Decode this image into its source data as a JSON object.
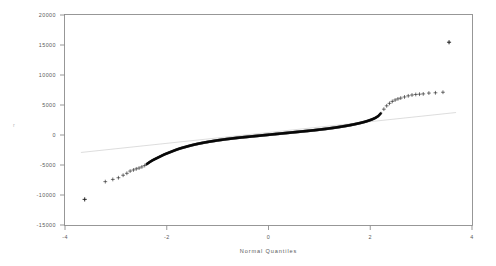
{
  "chart_data": {
    "type": "scatter",
    "title": "",
    "subtitle": "",
    "xlabel": "Normal Quantiles",
    "ylabel": "r",
    "xlim": [
      -4.35,
      4.35
    ],
    "ylim": [
      -16500,
      21500
    ],
    "xticks": [
      -4,
      -2,
      0,
      2,
      4
    ],
    "xticklabels": [
      "-4",
      "-2",
      "0",
      "2",
      "4"
    ],
    "yticks": [
      -15000,
      -10000,
      -5000,
      0,
      5000,
      10000,
      15000,
      20000
    ],
    "yticklabels": [
      "-15000",
      "-10000",
      "-5000",
      "0",
      "5000",
      "10000",
      "15000",
      "20000"
    ],
    "grid": false,
    "legend": null,
    "marker": "+",
    "marker_color": "#0b0b0b",
    "reference_line": {
      "type": "line",
      "color": "#cfcfcf",
      "slope": 900,
      "intercept": 250,
      "x_start": -4.0,
      "y_start": -3350,
      "x_end": 4.0,
      "y_end": 3850
    },
    "series": [
      {
        "name": "sample quantiles",
        "x": [
          -3.92,
          -3.48,
          -3.32,
          -3.2,
          -3.1,
          -3.02,
          -2.95,
          -2.88,
          -2.82,
          -2.76,
          -2.7,
          -2.64,
          -2.58,
          -2.52,
          -2.46,
          -2.4,
          -2.34,
          -2.28,
          -2.22,
          -2.16,
          -2.1,
          -2.04,
          -1.98,
          -1.92,
          -1.86,
          -1.8,
          -1.74,
          -1.68,
          -1.62,
          -1.56,
          -1.5,
          -1.44,
          -1.38,
          -1.32,
          -1.26,
          -1.2,
          -1.14,
          -1.08,
          -1.02,
          -0.96,
          -0.9,
          -0.84,
          -0.78,
          -0.72,
          -0.66,
          -0.6,
          -0.54,
          -0.48,
          -0.42,
          -0.36,
          -0.3,
          -0.24,
          -0.18,
          -0.12,
          -0.06,
          0.0,
          0.06,
          0.12,
          0.18,
          0.24,
          0.3,
          0.36,
          0.42,
          0.48,
          0.54,
          0.6,
          0.66,
          0.72,
          0.78,
          0.84,
          0.9,
          0.96,
          1.02,
          1.08,
          1.14,
          1.2,
          1.26,
          1.32,
          1.38,
          1.44,
          1.5,
          1.56,
          1.62,
          1.68,
          1.74,
          1.8,
          1.86,
          1.92,
          1.98,
          2.04,
          2.1,
          2.16,
          2.22,
          2.28,
          2.34,
          2.4,
          2.46,
          2.52,
          2.58,
          2.64,
          2.7,
          2.76,
          2.82,
          2.9,
          2.98,
          3.06,
          3.14,
          3.22,
          3.3,
          3.42,
          3.56,
          3.72,
          3.85
        ],
        "y": [
          -11800,
          -8600,
          -8200,
          -7900,
          -7450,
          -7100,
          -6700,
          -6500,
          -6300,
          -6150,
          -5950,
          -5700,
          -5350,
          -5000,
          -4700,
          -4450,
          -4200,
          -3950,
          -3700,
          -3500,
          -3300,
          -3100,
          -2900,
          -2720,
          -2560,
          -2420,
          -2280,
          -2140,
          -2010,
          -1890,
          -1780,
          -1680,
          -1580,
          -1490,
          -1400,
          -1320,
          -1240,
          -1160,
          -1090,
          -1020,
          -950,
          -890,
          -830,
          -770,
          -710,
          -660,
          -610,
          -560,
          -510,
          -460,
          -410,
          -360,
          -310,
          -260,
          -210,
          -160,
          -110,
          -60,
          -10,
          40,
          90,
          140,
          190,
          240,
          290,
          340,
          390,
          440,
          490,
          540,
          590,
          640,
          700,
          760,
          820,
          880,
          940,
          1010,
          1080,
          1150,
          1230,
          1310,
          1390,
          1480,
          1570,
          1670,
          1780,
          1890,
          2010,
          2140,
          2290,
          2460,
          2650,
          2880,
          3200,
          3750,
          4450,
          5050,
          5500,
          5850,
          6100,
          6300,
          6450,
          6650,
          6850,
          7000,
          7100,
          7150,
          7200,
          7350,
          7400,
          7500,
          16500
        ]
      }
    ],
    "dense_band": {
      "description": "overplotted solid band of markers from x -2.6 to x 2.4",
      "x_start": -2.6,
      "x_end": 2.4
    },
    "outliers": [
      {
        "x": -3.92,
        "y": -11800,
        "label": ""
      },
      {
        "x": 3.85,
        "y": 16500,
        "label": ""
      }
    ]
  }
}
